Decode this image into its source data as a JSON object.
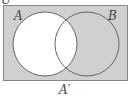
{
  "diagram": {
    "type": "venn",
    "universal_label": "U",
    "set_a_label": "A",
    "set_b_label": "B",
    "caption": "A′",
    "shaded_region": "complement of A",
    "colors": {
      "shaded": "#d0d0d0",
      "unshaded": "#ffffff",
      "stroke": "#666666"
    }
  }
}
